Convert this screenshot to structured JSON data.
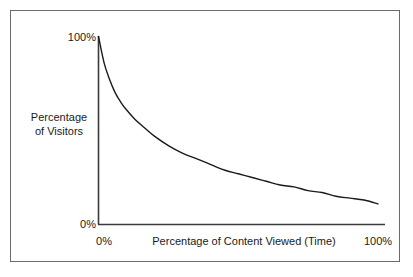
{
  "figure": {
    "frame_color": "#6b6b6b",
    "background": "#ffffff",
    "axis_color": "#3a3a3a",
    "curve_color": "#1a1a1a"
  },
  "axis_labels": {
    "y_max": "100%",
    "y_min": "0%",
    "y_title_line1": "Percentage",
    "y_title_line2": "of Visitors",
    "y_title": "Percentage of Visitors",
    "x_min": "0%",
    "x_max": "100%",
    "x_title": "Percentage of Content Viewed (Time)"
  },
  "chart_data": {
    "type": "line",
    "title": "",
    "subtitle": "",
    "xlabel": "Percentage of Content Viewed (Time)",
    "ylabel": "Percentage of Visitors",
    "xlim": [
      0,
      100
    ],
    "ylim": [
      0,
      100
    ],
    "xticks": [
      0,
      100
    ],
    "xticklabels": [
      "0%",
      "100%"
    ],
    "yticks": [
      0,
      100
    ],
    "yticklabels": [
      "0%",
      "100%"
    ],
    "grid": false,
    "legend": false,
    "legend_position": "none",
    "annotations": [],
    "series": [
      {
        "name": "Percentage of Visitors",
        "x": [
          0,
          2,
          4,
          6,
          8,
          10,
          13,
          16,
          20,
          25,
          30,
          35,
          40,
          45,
          50,
          55,
          60,
          65,
          70,
          75,
          80,
          85,
          90,
          95,
          100
        ],
        "values": [
          100,
          86,
          77,
          70,
          65,
          61,
          56,
          52,
          47,
          42,
          38,
          35,
          32,
          29,
          27,
          25,
          23,
          21,
          20,
          18,
          17,
          15,
          14,
          13,
          11
        ]
      }
    ]
  }
}
